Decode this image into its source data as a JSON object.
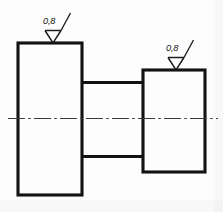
{
  "drawing": {
    "title": "Stepped shaft part view",
    "type": "mechanical-engineering-orthographic-view",
    "canvas": {
      "width": 223,
      "height": 212,
      "background": "#fdfdfd"
    },
    "line_color": "#121212",
    "centerline_color": "#3a3a3a",
    "features": {
      "left_flange": {
        "name": "left-flange-rectangle",
        "x": 18,
        "y": 43,
        "width": 64,
        "height": 152
      },
      "middle_shaft": {
        "name": "middle-shaft-body",
        "x": 82,
        "y": 82,
        "width": 61,
        "height": 75
      },
      "right_boss": {
        "name": "right-boss-rectangle",
        "x": 143,
        "y": 70,
        "width": 62,
        "height": 102
      },
      "axis": {
        "name": "horizontal-axis-centerline",
        "x1": 8,
        "y1": 118,
        "x2": 218,
        "y2": 118,
        "style": "dash-dot"
      }
    },
    "annotations": [
      {
        "id": "roughness-left",
        "name": "surface-roughness-symbol-left",
        "value": "0,8",
        "symbol": "surface-roughness-triangle",
        "unit": "Ra micrometers",
        "text_x": 43,
        "text_y": 24,
        "apex_x": 53,
        "apex_y": 43
      },
      {
        "id": "roughness-right",
        "name": "surface-roughness-symbol-right",
        "value": "0,8",
        "symbol": "surface-roughness-triangle",
        "unit": "Ra micrometers",
        "text_x": 166,
        "text_y": 51,
        "apex_x": 176,
        "apex_y": 70
      }
    ]
  }
}
